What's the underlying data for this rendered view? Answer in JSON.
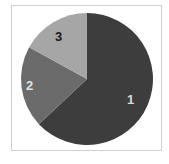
{
  "chart_data": {
    "type": "pie",
    "title": "",
    "categories": [
      "1",
      "2",
      "3"
    ],
    "values": [
      63,
      20,
      17
    ],
    "colors": [
      "#3d3d3d",
      "#6b6b6b",
      "#a6a6a6"
    ],
    "label_colors": [
      "#d8d8d8",
      "#e2e2e2",
      "#1a1a1a"
    ],
    "start_angle": "top (12 o'clock)",
    "direction": "clockwise",
    "legend": "none",
    "labels_inside": true
  },
  "labels": {
    "slice1": "1",
    "slice2": "2",
    "slice3": "3"
  }
}
